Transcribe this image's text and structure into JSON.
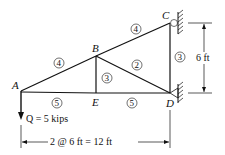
{
  "diagram": {
    "type": "plane truss",
    "nodes": [
      {
        "id": "A",
        "label": "A",
        "x": 21,
        "y": 91
      },
      {
        "id": "B",
        "label": "B",
        "x": 96,
        "y": 56
      },
      {
        "id": "C",
        "label": "C",
        "x": 170,
        "y": 23
      },
      {
        "id": "D",
        "label": "D",
        "x": 170,
        "y": 93
      },
      {
        "id": "E",
        "label": "E",
        "x": 96,
        "y": 93
      }
    ],
    "members": [
      {
        "from": "A",
        "to": "B",
        "label": "4"
      },
      {
        "from": "B",
        "to": "C",
        "label": "4"
      },
      {
        "from": "A",
        "to": "E",
        "label": "5"
      },
      {
        "from": "E",
        "to": "D",
        "label": "5"
      },
      {
        "from": "B",
        "to": "E",
        "label": "3"
      },
      {
        "from": "B",
        "to": "D",
        "label": "2"
      },
      {
        "from": "C",
        "to": "D",
        "label": "3"
      }
    ],
    "supports": [
      {
        "node": "C",
        "type": "roller"
      },
      {
        "node": "D",
        "type": "pin"
      }
    ],
    "load": {
      "node": "A",
      "label": "Q = 5 kips",
      "direction": "down"
    },
    "dimensions": {
      "horizontal": "2 @ 6 ft = 12 ft",
      "vertical": "6 ft"
    }
  }
}
